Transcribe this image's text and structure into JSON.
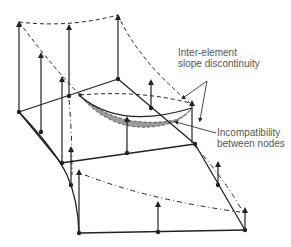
{
  "diagram": {
    "annotations": [
      {
        "id": "slope",
        "lines": [
          "Inter-element",
          "slope discontinuity"
        ]
      },
      {
        "id": "incompat",
        "lines": [
          "Incompatibility",
          "between nodes"
        ]
      }
    ],
    "colors": {
      "line": "#222222",
      "shade": "#9a9a9a",
      "text": "#555555"
    }
  }
}
